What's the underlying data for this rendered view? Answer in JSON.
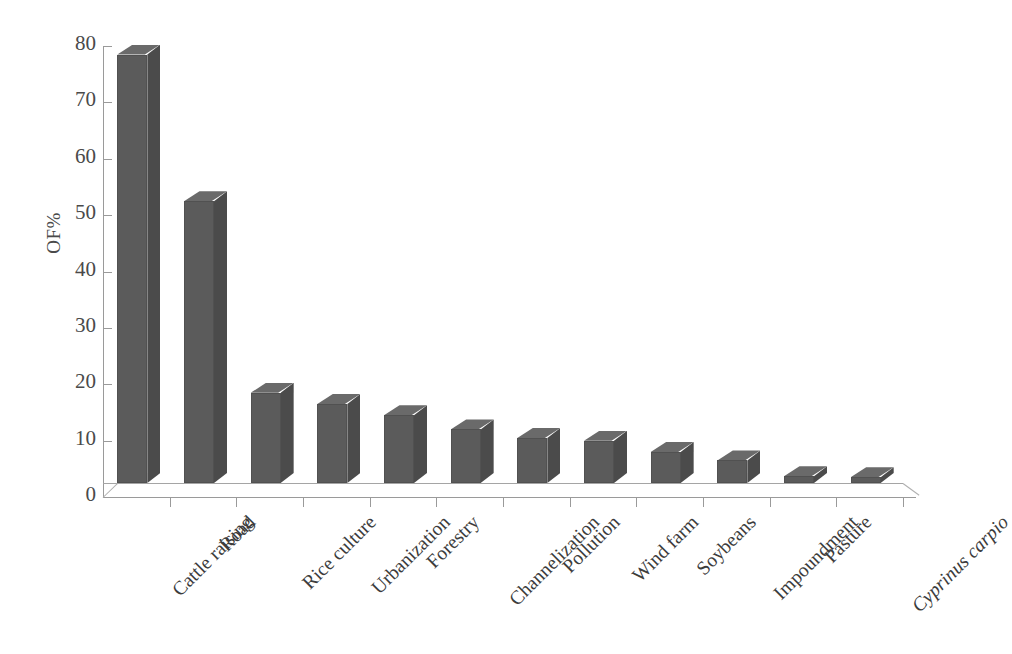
{
  "chart_data": {
    "type": "bar",
    "title": "",
    "subtitle": "",
    "xlabel": "",
    "ylabel": "OF%",
    "ylim": [
      0,
      80
    ],
    "ytick_step": 10,
    "yticks": [
      80,
      70,
      60,
      50,
      40,
      30,
      20,
      10,
      0
    ],
    "grid": false,
    "legend": "none",
    "style_3d": true,
    "bar_color": "#5b5b5b",
    "bar_side_color": "#4b4b4b",
    "bar_top_color": "#6a6a6a",
    "axis_color": "#9a9a9a",
    "categories": [
      "Cattle raising",
      "Road",
      "Rice culture",
      "Urbanization",
      "Forestry",
      "Channelization",
      "Pollution",
      "Wind farm",
      "Soybeans",
      "Impoundment",
      "Pasture",
      "Cyprinus carpio"
    ],
    "category_styles": [
      "normal",
      "normal",
      "normal",
      "normal",
      "normal",
      "normal",
      "normal",
      "normal",
      "normal",
      "normal",
      "normal",
      "italic"
    ],
    "values": [
      76,
      50,
      16,
      14,
      12,
      9.5,
      8,
      7.5,
      5.5,
      4,
      1.2,
      1
    ]
  }
}
